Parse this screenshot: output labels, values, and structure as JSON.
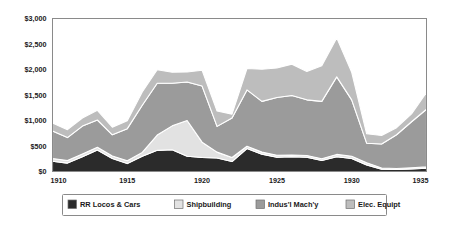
{
  "chart_data": {
    "type": "area",
    "stacked": true,
    "title": "",
    "subtitle": "",
    "xlabel": "",
    "ylabel": "",
    "x": [
      1910,
      1911,
      1912,
      1913,
      1914,
      1915,
      1916,
      1917,
      1918,
      1919,
      1920,
      1921,
      1922,
      1923,
      1924,
      1925,
      1926,
      1927,
      1928,
      1929,
      1930,
      1931,
      1932,
      1933,
      1934,
      1935
    ],
    "xlim": [
      1910,
      1935
    ],
    "ylim": [
      0,
      3000
    ],
    "xticks": [
      1910,
      1915,
      1920,
      1925,
      1930,
      1935
    ],
    "xtick_labels": [
      "1910",
      "1915",
      "1920",
      "1925",
      "1930",
      "1935"
    ],
    "yticks": [
      0,
      500,
      1000,
      1500,
      2000,
      2500,
      3000
    ],
    "ytick_labels": [
      "$0",
      "$500",
      "$1,000",
      "$1,500",
      "$2,000",
      "$2,500",
      "$3,000"
    ],
    "grid": false,
    "legend_position": "bottom",
    "series": [
      {
        "name": "RR Locos & Cars",
        "color": "#2b2b2b",
        "values": [
          200,
          165,
          290,
          420,
          255,
          155,
          300,
          415,
          425,
          300,
          275,
          265,
          195,
          450,
          340,
          280,
          290,
          280,
          215,
          290,
          255,
          130,
          45,
          40,
          50,
          65
        ]
      },
      {
        "name": "Shipbuilding",
        "color": "#e2e2e2",
        "values": [
          55,
          50,
          55,
          55,
          50,
          55,
          75,
          300,
          470,
          700,
          300,
          115,
          80,
          45,
          40,
          40,
          35,
          35,
          35,
          45,
          45,
          40,
          25,
          20,
          25,
          25
        ]
      },
      {
        "name": "Indus'l Mach'y",
        "color": "#9b9b9b",
        "values": [
          540,
          450,
          545,
          535,
          415,
          630,
          925,
          1015,
          835,
          755,
          1100,
          505,
          775,
          1105,
          995,
          1130,
          1165,
          1090,
          1125,
          1520,
          1105,
          385,
          470,
          660,
          900,
          1130
        ]
      },
      {
        "name": "Elec. Equipt",
        "color": "#bdbdbd",
        "values": [
          155,
          155,
          160,
          190,
          150,
          155,
          260,
          265,
          215,
          195,
          310,
          300,
          75,
          420,
          630,
          580,
          615,
          555,
          700,
          765,
          540,
          185,
          165,
          140,
          155,
          330
        ]
      }
    ],
    "series_totals": [
      950,
      820,
      1050,
      1200,
      870,
      995,
      1560,
      1995,
      1945,
      1950,
      1985,
      1185,
      1125,
      2020,
      2005,
      2030,
      2105,
      1960,
      2075,
      2620,
      1945,
      740,
      705,
      860,
      1130,
      1550
    ]
  },
  "legend": {
    "items": [
      {
        "label": "RR Locos & Cars",
        "color": "#2b2b2b"
      },
      {
        "label": "Shipbuilding",
        "color": "#e2e2e2"
      },
      {
        "label": "Indus'l Mach'y",
        "color": "#9b9b9b"
      },
      {
        "label": "Elec. Equipt",
        "color": "#bdbdbd"
      }
    ]
  },
  "style": {
    "background": "#ffffff",
    "frame_color": "#8a8a8a",
    "text_color": "#1a1a1a",
    "separator_color": "#ffffff"
  }
}
